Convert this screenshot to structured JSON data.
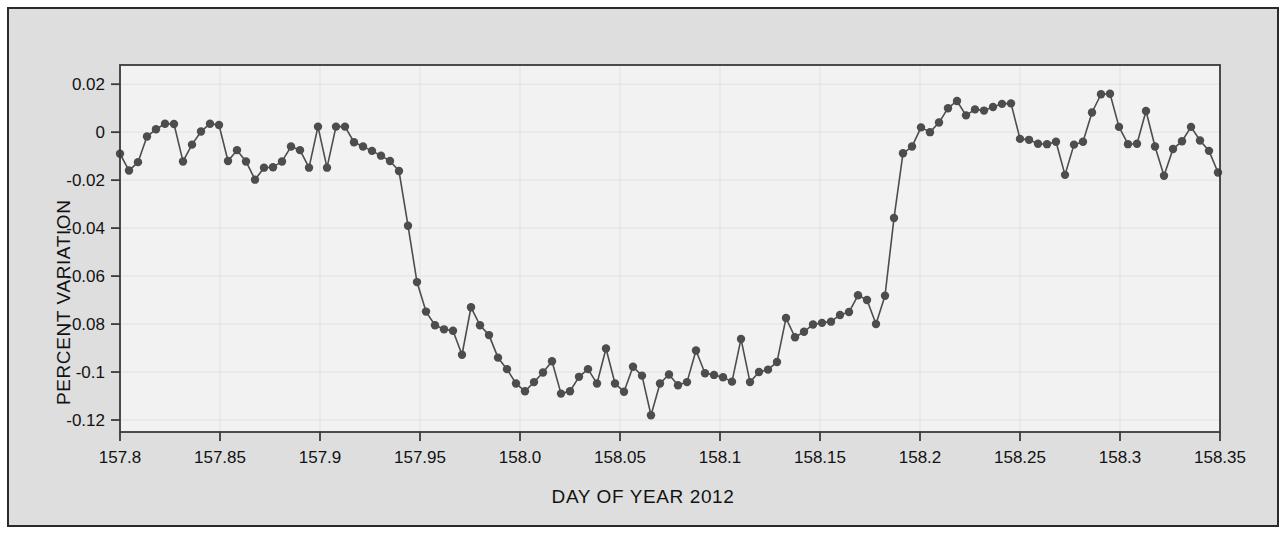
{
  "chart_data": {
    "type": "line",
    "title": "",
    "subtitle": "",
    "xlabel": "DAY OF YEAR 2012",
    "ylabel": "PERCENT VARIATION",
    "xlim": [
      157.8,
      158.35
    ],
    "ylim": [
      -0.125,
      0.028
    ],
    "grid": true,
    "legend": null,
    "annotations": [],
    "marker": "filled-circle",
    "series_color": "#4d4d4d",
    "plot_background": "#f2f2f2",
    "figure_background": "#dedede",
    "border_color": "#2a2a2a",
    "xticks": [
      157.8,
      157.85,
      157.9,
      157.95,
      158.0,
      158.05,
      158.1,
      158.15,
      158.2,
      158.25,
      158.3,
      158.35
    ],
    "xticklabels": [
      "157.8",
      "157.85",
      "157.9",
      "157.95",
      "158.0",
      "158.05",
      "158.1",
      "158.15",
      "158.2",
      "158.25",
      "158.3",
      "158.35"
    ],
    "yticks": [
      0.02,
      0,
      -0.02,
      -0.04,
      -0.06,
      -0.08,
      -0.1,
      -0.12
    ],
    "yticklabels": [
      "0.02",
      "0",
      "-0.02",
      "-0.04",
      "-0.06",
      "-0.08",
      "-0.1",
      "-0.12"
    ],
    "series": [
      {
        "name": "transit light curve",
        "x": [
          157.8,
          157.8045,
          157.809,
          157.8135,
          157.818,
          157.8225,
          157.827,
          157.8315,
          157.836,
          157.8405,
          157.845,
          157.8495,
          157.854,
          157.8585,
          157.863,
          157.8675,
          157.872,
          157.8765,
          157.881,
          157.8855,
          157.89,
          157.8945,
          157.899,
          157.9035,
          157.908,
          157.9125,
          157.917,
          157.9215,
          157.926,
          157.9305,
          157.935,
          157.9395,
          157.944,
          157.9485,
          157.953,
          157.9575,
          157.962,
          157.9665,
          157.971,
          157.9755,
          157.98,
          157.9845,
          157.989,
          157.9935,
          157.998,
          158.0025,
          158.007,
          158.0115,
          158.016,
          158.0205,
          158.025,
          158.0295,
          158.034,
          158.0385,
          158.043,
          158.0475,
          158.052,
          158.0565,
          158.061,
          158.0655,
          158.07,
          158.0745,
          158.079,
          158.0835,
          158.088,
          158.0925,
          158.097,
          158.1015,
          158.106,
          158.1105,
          158.115,
          158.1195,
          158.124,
          158.1285,
          158.133,
          158.1375,
          158.142,
          158.1465,
          158.151,
          158.1555,
          158.16,
          158.1645,
          158.169,
          158.1735,
          158.178,
          158.1825,
          158.187,
          158.1915,
          158.196,
          158.2005,
          158.205,
          158.2095,
          158.214,
          158.2185,
          158.223,
          158.2275,
          158.232,
          158.2365,
          158.241,
          158.2455,
          158.25,
          158.2545,
          158.259,
          158.2635,
          158.268,
          158.2725,
          158.277,
          158.2815,
          158.286,
          158.2905,
          158.295,
          158.2995,
          158.304,
          158.3085,
          158.313,
          158.3175,
          158.322,
          158.3265,
          158.331,
          158.3355,
          158.34,
          158.3445,
          158.349
        ],
        "y": [
          -0.009,
          -0.016,
          -0.0125,
          -0.0018,
          0.0012,
          0.0035,
          0.0034,
          -0.0122,
          -0.0052,
          0.0003,
          0.0035,
          0.003,
          -0.012,
          -0.0075,
          -0.0122,
          -0.0198,
          -0.0148,
          -0.0146,
          -0.0122,
          -0.006,
          -0.0075,
          -0.0148,
          0.0023,
          -0.0148,
          0.0023,
          0.0023,
          -0.0042,
          -0.006,
          -0.0078,
          -0.0098,
          -0.012,
          -0.0162,
          -0.039,
          -0.0625,
          -0.0748,
          -0.0805,
          -0.0822,
          -0.0828,
          -0.0928,
          -0.073,
          -0.0805,
          -0.0846,
          -0.094,
          -0.0988,
          -0.1048,
          -0.108,
          -0.1042,
          -0.1002,
          -0.0955,
          -0.109,
          -0.108,
          -0.102,
          -0.0988,
          -0.1048,
          -0.0902,
          -0.1048,
          -0.1082,
          -0.0978,
          -0.1015,
          -0.118,
          -0.1048,
          -0.101,
          -0.1055,
          -0.1042,
          -0.091,
          -0.1005,
          -0.1012,
          -0.1022,
          -0.104,
          -0.0862,
          -0.1042,
          -0.1,
          -0.099,
          -0.0958,
          -0.0775,
          -0.0855,
          -0.0832,
          -0.0802,
          -0.0795,
          -0.079,
          -0.0762,
          -0.075,
          -0.068,
          -0.07,
          -0.08,
          -0.0682,
          -0.0358,
          -0.0088,
          -0.006,
          0.002,
          0.0,
          0.004,
          0.01,
          0.013,
          0.007,
          0.0095,
          0.009,
          0.0105,
          0.0118,
          0.012,
          -0.0028,
          -0.0032,
          -0.0048,
          -0.005,
          -0.004,
          -0.0178,
          -0.0052,
          -0.004,
          0.0082,
          0.0158,
          0.016,
          0.0022,
          -0.005,
          -0.0048,
          0.0088,
          -0.006,
          -0.0182,
          -0.007,
          -0.0038,
          0.0022,
          -0.0035,
          -0.0078,
          -0.0168
        ]
      }
    ]
  }
}
